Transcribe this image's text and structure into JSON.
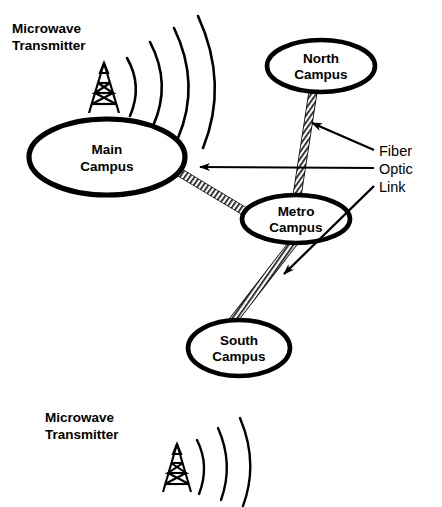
{
  "diagram": {
    "background_color": "#ffffff",
    "stroke_color": "#000000",
    "nodes": [
      {
        "id": "north-campus",
        "line1": "North",
        "line2": "Campus",
        "cx": 321,
        "cy": 66,
        "rx": 54,
        "ry": 26
      },
      {
        "id": "main-campus",
        "line1": "Main",
        "line2": "Campus",
        "cx": 107,
        "cy": 157,
        "rx": 78,
        "ry": 38
      },
      {
        "id": "metro-campus",
        "line1": "Metro",
        "line2": "Campus",
        "cx": 296,
        "cy": 219,
        "rx": 54,
        "ry": 24
      },
      {
        "id": "south-campus",
        "line1": "South",
        "line2": "Campus",
        "cx": 239,
        "cy": 348,
        "rx": 51,
        "ry": 28
      }
    ],
    "links": [
      {
        "id": "link-north-metro",
        "type": "fiber-optic",
        "from": "north-campus",
        "to": "metro-campus",
        "x1": 313,
        "y1": 92,
        "x2": 297,
        "y2": 196
      },
      {
        "id": "link-main-metro",
        "type": "fiber-optic",
        "from": "metro-campus",
        "to": "main-campus",
        "x1": 249,
        "y1": 214,
        "x2": 179,
        "y2": 172
      },
      {
        "id": "link-metro-south",
        "type": "fiber-optic",
        "from": "metro-campus",
        "to": "south-campus",
        "x1": 294,
        "y1": 242,
        "x2": 232,
        "y2": 322
      }
    ],
    "annotations": [
      {
        "id": "fiber-optic-link-label",
        "line1": "Fiber",
        "line2": "Optic",
        "line3": "Link",
        "x": 379,
        "y": 156,
        "leaders": [
          {
            "id": "leader-to-north-metro",
            "x1": 374,
            "y1": 150,
            "x2": 310,
            "y2": 122,
            "arrow": true
          },
          {
            "id": "leader-to-main-metro",
            "x1": 374,
            "y1": 168,
            "x2": 198,
            "y2": 167,
            "arrow": true
          },
          {
            "id": "leader-to-metro-south",
            "x1": 374,
            "y1": 186,
            "x2": 282,
            "y2": 276,
            "arrow": true
          }
        ]
      }
    ],
    "transmitters": [
      {
        "id": "microwave-transmitter-top",
        "line1": "Microwave",
        "line2": "Transmitter",
        "label_x": 12,
        "label_y": 32,
        "tower_x": 104,
        "tower_base_y": 113,
        "tower_height": 50,
        "tower_half_width": 15,
        "waves": 4,
        "wave_direction": "right"
      },
      {
        "id": "microwave-transmitter-bottom",
        "line1": "Microwave",
        "line2": "Transmitter",
        "label_x": 45,
        "label_y": 421,
        "tower_x": 177,
        "tower_base_y": 492,
        "tower_height": 48,
        "tower_half_width": 14,
        "waves": 3,
        "wave_direction": "right"
      }
    ]
  }
}
